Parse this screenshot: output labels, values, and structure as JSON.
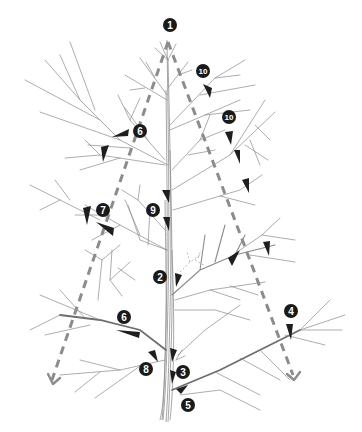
{
  "diagram": {
    "title": "",
    "colors": {
      "background": "#ffffff",
      "branch": "#8a8a8a",
      "guide_dashes": "#8c8c8c",
      "cut_marker": "#1e1e1e",
      "badge_fill": "#1a1a1a",
      "badge_text": "#ffffff"
    },
    "labels": [
      {
        "id": "label-1",
        "text": "1",
        "x": 168,
        "y": 25
      },
      {
        "id": "label-10a",
        "text": "10",
        "x": 203,
        "y": 71
      },
      {
        "id": "label-10b",
        "text": "10",
        "x": 229,
        "y": 117
      },
      {
        "id": "label-6a",
        "text": "6",
        "x": 140,
        "y": 131
      },
      {
        "id": "label-7",
        "text": "7",
        "x": 103,
        "y": 210
      },
      {
        "id": "label-9",
        "text": "9",
        "x": 153,
        "y": 210
      },
      {
        "id": "label-2",
        "text": "2",
        "x": 160,
        "y": 277
      },
      {
        "id": "label-4",
        "text": "4",
        "x": 291,
        "y": 311
      },
      {
        "id": "label-6b",
        "text": "6",
        "x": 124,
        "y": 317
      },
      {
        "id": "label-8",
        "text": "8",
        "x": 146,
        "y": 369
      },
      {
        "id": "label-3",
        "text": "3",
        "x": 183,
        "y": 372
      },
      {
        "id": "label-5",
        "text": "5",
        "x": 188,
        "y": 405
      }
    ]
  }
}
